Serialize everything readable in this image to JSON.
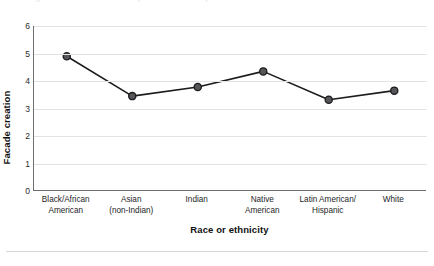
{
  "figure": {
    "top_caption_fragment": "Figure 2. Facade creation by race or ethnicity",
    "background_color": "#ffffff"
  },
  "chart_data": {
    "type": "line",
    "title": "",
    "xlabel": "Race or ethnicity",
    "ylabel": "Facade creation",
    "categories": [
      "Black/African\nAmerican",
      "Asian\n(non-Indian)",
      "Indian",
      "Native\nAmerican",
      "Latin American/\nHispanic",
      "White"
    ],
    "category_lines": [
      [
        "Black/African",
        "American"
      ],
      [
        "Asian",
        "(non-Indian)"
      ],
      [
        "Indian",
        ""
      ],
      [
        "Native",
        "American"
      ],
      [
        "Latin American/",
        "Hispanic"
      ],
      [
        "White",
        ""
      ]
    ],
    "values": [
      4.9,
      3.45,
      3.78,
      4.35,
      3.32,
      3.65
    ],
    "series": [
      {
        "name": "Facade creation",
        "values": [
          4.9,
          3.45,
          3.78,
          4.35,
          3.32,
          3.65
        ]
      }
    ],
    "ylim": [
      0,
      6
    ],
    "yticks": [
      0,
      1,
      2,
      3,
      4,
      5,
      6
    ],
    "ytick_labels": [
      "0",
      "1",
      "2",
      "3",
      "4",
      "5",
      "6"
    ],
    "grid": "horizontal",
    "legend": "none",
    "line_color": "#1c1c1c",
    "marker_color": "#55555a",
    "marker_edge_color": "#1c1c1c",
    "gridline_color": "#e3e3e6",
    "axis_color": "#6e6e72"
  }
}
